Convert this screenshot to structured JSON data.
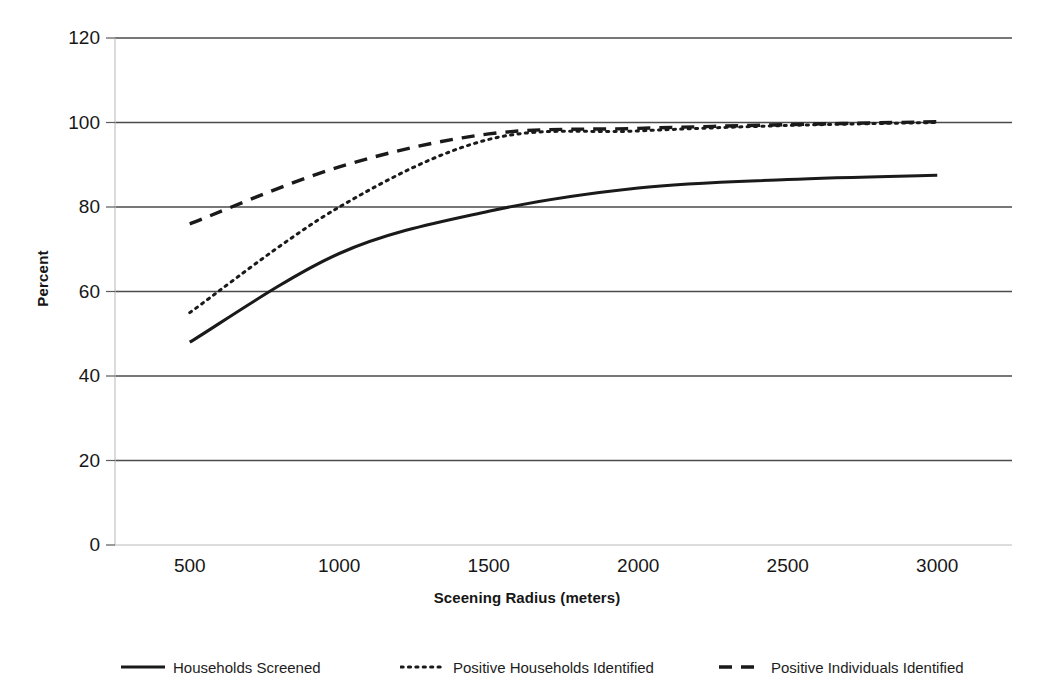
{
  "chart_data": {
    "type": "line",
    "title": "",
    "xlabel": "Sceening Radius (meters)",
    "ylabel": "Percent",
    "x": [
      500,
      1000,
      1500,
      2000,
      2500,
      3000
    ],
    "xtick_labels": [
      "500",
      "1000",
      "1500",
      "2000",
      "2500",
      "3000"
    ],
    "ytick_labels": [
      "0",
      "20",
      "40",
      "60",
      "80",
      "100",
      "120"
    ],
    "ylim": [
      0,
      120
    ],
    "xlim": [
      250,
      3250
    ],
    "grid": "horizontal",
    "legend_position": "bottom",
    "series": [
      {
        "name": "Households Screened",
        "style": "solid",
        "color": "#1a1a1a",
        "values": [
          48,
          69,
          79,
          84.5,
          86.5,
          87.5
        ]
      },
      {
        "name": "Positive Households Identified",
        "style": "dotted",
        "color": "#1a1a1a",
        "values": [
          55,
          80,
          96,
          98,
          99.3,
          100
        ]
      },
      {
        "name": "Positive Individuals Identified",
        "style": "dashed",
        "color": "#1a1a1a",
        "values": [
          76,
          89.5,
          97.3,
          98.6,
          99.5,
          100.2
        ]
      }
    ]
  },
  "axes": {
    "y_title": "Percent",
    "x_title": "Sceening Radius (meters)"
  },
  "legend": {
    "items": [
      {
        "label": "Households Screened",
        "style": "solid"
      },
      {
        "label": "Positive Households Identified",
        "style": "dotted"
      },
      {
        "label": "Positive Individuals Identified",
        "style": "dashed"
      }
    ]
  }
}
